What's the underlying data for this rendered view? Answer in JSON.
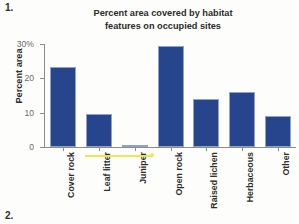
{
  "page": {
    "number_top": "1.",
    "number_bottom": "2."
  },
  "chart_data": {
    "type": "bar",
    "title": "Percent area covered by habitat features on occupied sites",
    "title_lines": [
      "Percent area covered by habitat",
      "features on occupied sites"
    ],
    "xlabel": "",
    "ylabel": "Percent area",
    "categories": [
      "Cover rock",
      "Leaf litter",
      "Juniper",
      "Open rock",
      "Raised lichen",
      "Herbaceous",
      "Other"
    ],
    "values": [
      23.2,
      9.5,
      0.4,
      29.5,
      14.1,
      16.1,
      9.0
    ],
    "ylim": [
      0,
      30
    ],
    "yticks": [
      0,
      10,
      20,
      30
    ],
    "ytick_labels": [
      "0",
      "10",
      "20",
      "30%"
    ],
    "grid": false,
    "legend": false,
    "bar_color": "#27458c",
    "axis_color": "#8d8d88",
    "text_color": "#2c2c2a"
  },
  "annotations": {
    "highlighter_color": "#ece54a",
    "highlighter_note": "yellow highlighter stroke over Leaf litter / Juniper labels"
  }
}
